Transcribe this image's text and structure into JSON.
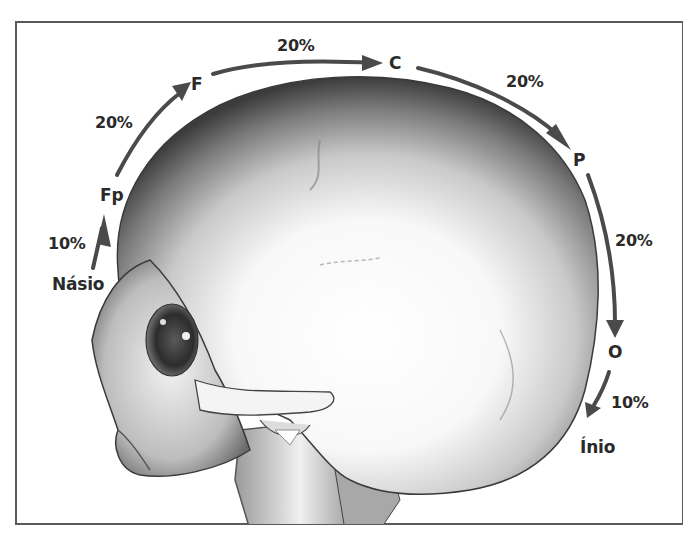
{
  "diagram": {
    "arrow_color": "#4a4a4a",
    "points": [
      {
        "id": "nasion",
        "label": "Násio"
      },
      {
        "id": "fp",
        "label": "Fp"
      },
      {
        "id": "f",
        "label": "F"
      },
      {
        "id": "c",
        "label": "C"
      },
      {
        "id": "p",
        "label": "P"
      },
      {
        "id": "o",
        "label": "O"
      },
      {
        "id": "inion",
        "label": "Ínio"
      }
    ],
    "segments": [
      {
        "from": "Násio",
        "to": "Fp",
        "label": "10%"
      },
      {
        "from": "Fp",
        "to": "F",
        "label": "20%"
      },
      {
        "from": "F",
        "to": "C",
        "label": "20%"
      },
      {
        "from": "C",
        "to": "P",
        "label": "20%"
      },
      {
        "from": "P",
        "to": "O",
        "label": "20%"
      },
      {
        "from": "O",
        "to": "Ínio",
        "label": "10%"
      }
    ]
  }
}
